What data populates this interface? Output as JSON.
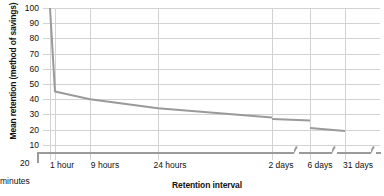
{
  "chart_data": {
    "type": "line",
    "title": "",
    "xlabel": "Retention interval",
    "ylabel": "Mean retention (method of savings)",
    "ylim": [
      0,
      100
    ],
    "yticks": [
      100,
      90,
      80,
      70,
      60,
      50,
      40,
      30,
      20,
      10
    ],
    "grid": true,
    "legend": "none",
    "origin_label": {
      "value": "20",
      "unit": "minutes"
    },
    "xticks": [
      "1 hour",
      "9 hours",
      "24 hours",
      "2 days",
      "6 days",
      "31 days"
    ],
    "axis_breaks": 3,
    "series": [
      {
        "name": "Mean retention",
        "color": "#9a9a9a",
        "segments": [
          {
            "name": "20 minutes to 2 days",
            "points": [
              {
                "x": "20 minutes",
                "y": 100
              },
              {
                "x": "1 hour",
                "y": 45
              },
              {
                "x": "9 hours",
                "y": 40
              },
              {
                "x": "24 hours",
                "y": 34
              },
              {
                "x": "2 days",
                "y": 28
              }
            ]
          },
          {
            "name": "2 days to 6 days",
            "points": [
              {
                "x": "2 days",
                "y": 27
              },
              {
                "x": "6 days",
                "y": 26
              }
            ]
          },
          {
            "name": "6 days to 31 days",
            "points": [
              {
                "x": "6 days",
                "y": 21
              },
              {
                "x": "31 days",
                "y": 19
              }
            ]
          }
        ]
      }
    ]
  }
}
